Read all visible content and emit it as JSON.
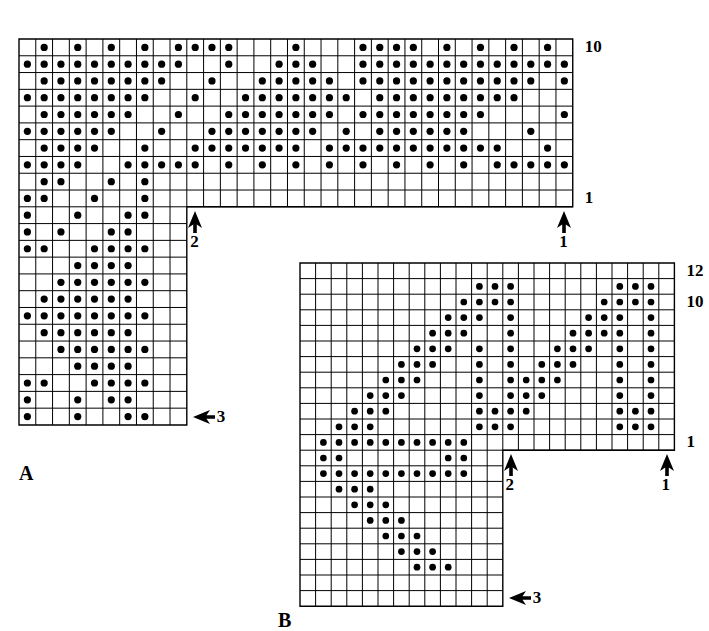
{
  "page": {
    "background_color": "#ffffff",
    "ink_color": "#000000",
    "width": 709,
    "height": 624
  },
  "chart_data": {
    "type": "heatmap",
    "cell_size_px": 16.8,
    "dot_color": "#000000",
    "grid_line_color": "#000000",
    "charts": [
      {
        "name": "A",
        "label": "A",
        "origin": {
          "x": 19,
          "y": 39
        },
        "cell": 16.78,
        "cols": 33,
        "rows": 23,
        "band_rows": 10,
        "stem_cols": 10,
        "row_labels": [
          {
            "text": "10",
            "row_from_top": 0
          },
          {
            "text": "1",
            "row_from_top": 9
          }
        ],
        "markers": [
          {
            "text": "1",
            "dir": "up",
            "col": 32
          },
          {
            "text": "2",
            "dir": "up",
            "col": 10
          },
          {
            "text": "3",
            "dir": "left",
            "row_from_top": 22
          }
        ],
        "filled": [
          [
            1,
            3,
            5,
            7,
            9,
            10,
            11,
            12,
            16,
            20,
            21,
            22,
            23,
            25,
            27,
            29,
            31
          ],
          [
            0,
            1,
            2,
            3,
            4,
            5,
            6,
            7,
            8,
            9,
            12,
            15,
            16,
            17,
            20,
            21,
            22,
            23,
            24,
            25,
            26,
            27,
            28,
            29,
            30,
            31,
            32
          ],
          [
            1,
            2,
            3,
            4,
            5,
            6,
            7,
            8,
            11,
            14,
            15,
            16,
            17,
            18,
            20,
            21,
            22,
            23,
            24,
            25,
            26,
            27,
            28,
            29,
            30,
            32
          ],
          [
            0,
            1,
            2,
            3,
            4,
            5,
            6,
            7,
            10,
            13,
            14,
            15,
            16,
            17,
            18,
            19,
            21,
            22,
            23,
            24,
            25,
            26,
            27,
            28,
            29
          ],
          [
            1,
            2,
            3,
            4,
            5,
            6,
            9,
            12,
            13,
            14,
            15,
            16,
            17,
            18,
            20,
            21,
            22,
            23,
            24,
            25,
            26,
            27,
            32
          ],
          [
            0,
            1,
            2,
            3,
            4,
            5,
            8,
            11,
            12,
            13,
            14,
            15,
            16,
            17,
            19,
            21,
            22,
            23,
            24,
            25,
            26,
            30
          ],
          [
            1,
            2,
            3,
            4,
            7,
            10,
            11,
            12,
            13,
            14,
            15,
            16,
            18,
            19,
            20,
            21,
            22,
            23,
            24,
            25,
            26,
            27,
            28,
            31
          ],
          [
            0,
            1,
            2,
            3,
            6,
            7,
            8,
            9,
            10,
            12,
            14,
            16,
            18,
            20,
            22,
            24,
            26,
            28,
            29,
            30,
            31,
            32
          ],
          [
            1,
            2,
            5,
            7
          ],
          [
            0,
            1,
            4,
            7
          ],
          [
            0,
            3,
            6,
            7
          ],
          [
            0,
            2,
            5,
            6
          ],
          [
            0,
            1,
            4,
            5,
            6,
            7
          ],
          [
            3,
            4,
            5,
            6
          ],
          [
            2,
            3,
            4,
            5,
            6,
            7
          ],
          [
            1,
            2,
            3,
            4,
            5,
            6
          ],
          [
            0,
            1,
            2,
            3,
            4,
            5,
            6,
            7
          ],
          [
            1,
            2,
            3,
            4,
            5,
            6
          ],
          [
            2,
            3,
            4,
            5,
            6,
            7
          ],
          [
            3,
            4,
            5,
            6
          ],
          [
            0,
            1,
            4,
            5,
            6,
            7
          ],
          [
            0,
            3,
            5,
            6
          ],
          [
            0,
            3,
            6,
            7
          ]
        ]
      },
      {
        "name": "B",
        "label": "B",
        "origin": {
          "x": 300,
          "y": 263
        },
        "cell": 15.6,
        "cols": 24,
        "rows": 22,
        "band_rows": 12,
        "stem_cols": 13,
        "row_labels": [
          {
            "text": "12",
            "row_from_top": 0
          },
          {
            "text": "10",
            "row_from_top": 2
          },
          {
            "text": "1",
            "row_from_top": 11
          }
        ],
        "markers": [
          {
            "text": "1",
            "dir": "up",
            "col": 23
          },
          {
            "text": "2",
            "dir": "up",
            "col": 13
          },
          {
            "text": "3",
            "dir": "left",
            "row_from_top": 21
          }
        ],
        "filled": [
          [],
          [
            11,
            12,
            13,
            20,
            21,
            22
          ],
          [
            10,
            11,
            12,
            13,
            19,
            20,
            21,
            22
          ],
          [
            9,
            10,
            11,
            13,
            18,
            19,
            20,
            22
          ],
          [
            8,
            9,
            10,
            13,
            17,
            18,
            19,
            20,
            22
          ],
          [
            7,
            8,
            9,
            11,
            13,
            16,
            17,
            18,
            20,
            22
          ],
          [
            6,
            7,
            8,
            11,
            13,
            15,
            16,
            17,
            20,
            22
          ],
          [
            5,
            6,
            7,
            11,
            13,
            14,
            15,
            16,
            20,
            22
          ],
          [
            4,
            5,
            6,
            11,
            13,
            14,
            15,
            20,
            22
          ],
          [
            3,
            4,
            5,
            11,
            12,
            13,
            14,
            20,
            21,
            22
          ],
          [
            2,
            3,
            4,
            11,
            12,
            13,
            20,
            21,
            22
          ],
          [
            1,
            2,
            3,
            4,
            5,
            6,
            7,
            8,
            9,
            10
          ],
          [
            1,
            2,
            9,
            10
          ],
          [
            1,
            2,
            3,
            4,
            5,
            6,
            7,
            8,
            9,
            10
          ],
          [
            2,
            3,
            4
          ],
          [
            3,
            4,
            5
          ],
          [
            4,
            5,
            6
          ],
          [
            5,
            6,
            7
          ],
          [
            6,
            7,
            8
          ],
          [
            7,
            8,
            9
          ],
          [],
          []
        ]
      }
    ]
  }
}
